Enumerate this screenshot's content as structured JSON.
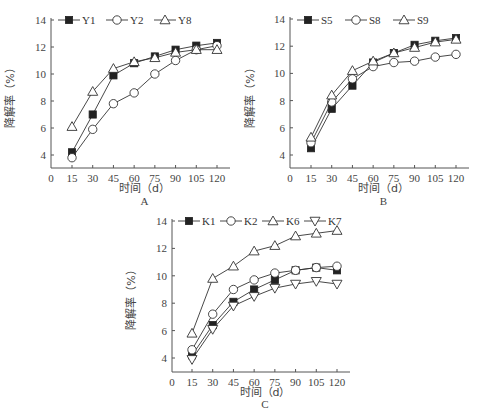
{
  "chart_data": [
    {
      "type": "line",
      "panel": "A",
      "title": "",
      "xlabel": "时间（d）",
      "ylabel": "降解率（%）",
      "x": [
        15,
        30,
        45,
        60,
        75,
        90,
        105,
        120
      ],
      "xticks": [
        0,
        15,
        30,
        45,
        60,
        75,
        90,
        105,
        120
      ],
      "yticks": [
        4,
        6,
        8,
        10,
        12,
        14
      ],
      "ylim": [
        3,
        14
      ],
      "xlim": [
        0,
        127
      ],
      "grid": false,
      "legend_position": "top",
      "series": [
        {
          "name": "Y1",
          "marker": "square-filled",
          "values": [
            4.2,
            7.0,
            9.9,
            10.8,
            11.3,
            11.8,
            12.1,
            12.3
          ]
        },
        {
          "name": "Y2",
          "marker": "circle-open",
          "values": [
            3.8,
            5.9,
            7.8,
            8.6,
            10.0,
            11.0,
            11.8,
            12.1
          ]
        },
        {
          "name": "Y8",
          "marker": "triangle-up-open",
          "values": [
            6.1,
            8.7,
            10.4,
            10.9,
            11.2,
            11.6,
            11.8,
            11.8
          ]
        }
      ]
    },
    {
      "type": "line",
      "panel": "B",
      "title": "",
      "xlabel": "时间（d）",
      "ylabel": "降解率（%）",
      "x": [
        15,
        30,
        45,
        60,
        75,
        90,
        105,
        120
      ],
      "xticks": [
        0,
        15,
        30,
        45,
        60,
        75,
        90,
        105,
        120
      ],
      "yticks": [
        4,
        6,
        8,
        10,
        12,
        14
      ],
      "ylim": [
        3,
        14
      ],
      "xlim": [
        0,
        127
      ],
      "grid": false,
      "legend_position": "top",
      "series": [
        {
          "name": "S5",
          "marker": "square-filled",
          "values": [
            4.5,
            7.4,
            9.1,
            10.8,
            11.5,
            12.1,
            12.4,
            12.6
          ]
        },
        {
          "name": "S8",
          "marker": "circle-open",
          "values": [
            4.9,
            7.9,
            9.6,
            10.5,
            10.8,
            10.9,
            11.2,
            11.4
          ]
        },
        {
          "name": "S9",
          "marker": "triangle-up-open",
          "values": [
            5.3,
            8.4,
            10.2,
            10.9,
            11.5,
            11.9,
            12.3,
            12.5
          ]
        }
      ]
    },
    {
      "type": "line",
      "panel": "C",
      "title": "",
      "xlabel": "时间（d）",
      "ylabel": "降解率（%）",
      "x": [
        15,
        30,
        45,
        60,
        75,
        90,
        105,
        120
      ],
      "xticks": [
        0,
        15,
        30,
        45,
        60,
        75,
        90,
        105,
        120
      ],
      "yticks": [
        4,
        6,
        8,
        10,
        12,
        14
      ],
      "ylim": [
        3,
        14
      ],
      "xlim": [
        0,
        127
      ],
      "grid": false,
      "legend_position": "top",
      "series": [
        {
          "name": "K1",
          "marker": "square-filled",
          "values": [
            4.2,
            6.4,
            8.1,
            9.0,
            9.7,
            10.4,
            10.6,
            10.4
          ]
        },
        {
          "name": "K2",
          "marker": "circle-open",
          "values": [
            4.6,
            7.2,
            9.0,
            9.7,
            10.2,
            10.4,
            10.6,
            10.7
          ]
        },
        {
          "name": "K6",
          "marker": "triangle-up-open",
          "values": [
            5.8,
            9.8,
            10.7,
            11.8,
            12.2,
            12.9,
            13.1,
            13.3
          ]
        },
        {
          "name": "K7",
          "marker": "triangle-down-open",
          "values": [
            3.9,
            6.1,
            7.8,
            8.5,
            9.1,
            9.4,
            9.6,
            9.4
          ]
        }
      ]
    }
  ],
  "style": {
    "line_color": "#333333",
    "axis_color": "#555555",
    "marker_fill": "#222222"
  }
}
